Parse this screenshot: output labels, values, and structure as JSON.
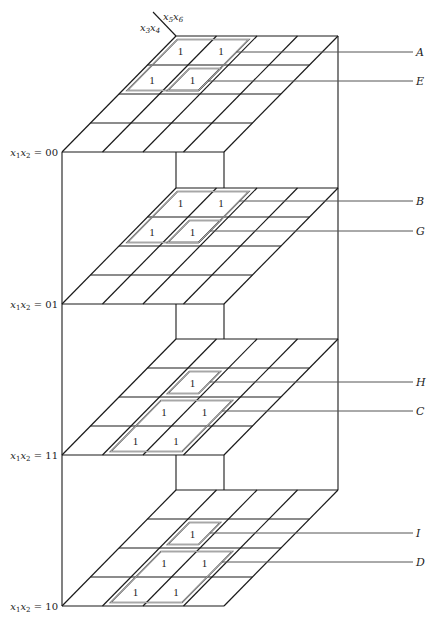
{
  "diagram": {
    "type": "six-variable-karnaugh-map-3d",
    "axis_labels": {
      "rows": "x3x4",
      "cols": "x5x6"
    },
    "grid": {
      "rows": 4,
      "cols": 4
    },
    "layers": [
      {
        "id": "layer-00",
        "label": "x1x2 = 00",
        "ones": [
          [
            0,
            0
          ],
          [
            0,
            1
          ],
          [
            1,
            0
          ],
          [
            1,
            1
          ]
        ],
        "loops": [
          {
            "name": "A",
            "r0": 0,
            "c0": 0,
            "r1": 2,
            "c1": 2,
            "inset": 0.12
          },
          {
            "name": "E",
            "r0": 1,
            "c0": 1,
            "r1": 2,
            "c1": 2,
            "inset": 0.12
          }
        ]
      },
      {
        "id": "layer-01",
        "label": "x1x2 = 01",
        "ones": [
          [
            0,
            0
          ],
          [
            0,
            1
          ],
          [
            1,
            0
          ],
          [
            1,
            1
          ]
        ],
        "loops": [
          {
            "name": "B",
            "r0": 0,
            "c0": 0,
            "r1": 2,
            "c1": 2,
            "inset": 0.12
          },
          {
            "name": "G",
            "r0": 1,
            "c0": 1,
            "r1": 2,
            "c1": 2,
            "inset": 0.12
          }
        ]
      },
      {
        "id": "layer-11",
        "label": "x1x2 = 11",
        "ones": [
          [
            1,
            1
          ],
          [
            2,
            1
          ],
          [
            2,
            2
          ],
          [
            3,
            1
          ],
          [
            3,
            2
          ]
        ],
        "loops": [
          {
            "name": "H",
            "r0": 1,
            "c0": 1,
            "r1": 2,
            "c1": 2,
            "inset": 0.12
          },
          {
            "name": "C",
            "r0": 2,
            "c0": 1,
            "r1": 4,
            "c1": 3,
            "inset": 0.12
          }
        ]
      },
      {
        "id": "layer-10",
        "label": "x1x2 = 10",
        "ones": [
          [
            1,
            1
          ],
          [
            2,
            1
          ],
          [
            2,
            2
          ],
          [
            3,
            1
          ],
          [
            3,
            2
          ]
        ],
        "loops": [
          {
            "name": "I",
            "r0": 1,
            "c0": 1,
            "r1": 2,
            "c1": 2,
            "inset": 0.12
          },
          {
            "name": "D",
            "r0": 2,
            "c0": 1,
            "r1": 4,
            "c1": 3,
            "inset": 0.12
          }
        ]
      }
    ],
    "loop_labels": [
      {
        "name": "A",
        "y": 52
      },
      {
        "name": "E",
        "y": 81
      },
      {
        "name": "B",
        "y": 201
      },
      {
        "name": "G",
        "y": 231
      },
      {
        "name": "H",
        "y": 382
      },
      {
        "name": "C",
        "y": 411
      },
      {
        "name": "I",
        "y": 533
      },
      {
        "name": "D",
        "y": 562
      }
    ],
    "cell_value": "1",
    "colors": {
      "line": "#1a1a1a",
      "loop": "#555555",
      "text": "#222222"
    }
  }
}
